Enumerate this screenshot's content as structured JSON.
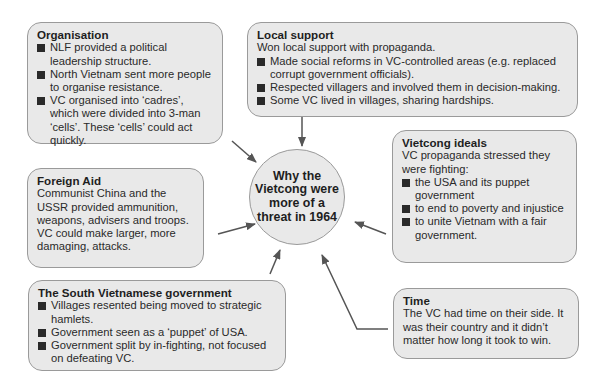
{
  "center": {
    "title": "Why the Vietcong were more of a threat in 1964"
  },
  "boxes": {
    "organisation": {
      "title": "Organisation",
      "bullets": [
        "NLF provided a political leadership structure.",
        "North Vietnam sent more people to organise resistance.",
        "VC organised into ‘cadres’, which were divided into 3-man ‘cells’. These ‘cells’ could act quickly."
      ]
    },
    "local_support": {
      "title": "Local support",
      "intro": "Won local support with propaganda.",
      "bullets": [
        "Made social reforms in VC-controlled areas (e.g. replaced corrupt government officials).",
        "Respected villagers and involved them in decision-making.",
        "Some VC lived in villages, sharing hardships."
      ]
    },
    "vietcong_ideals": {
      "title": "Vietcong ideals",
      "intro": "VC propaganda stressed they were fighting:",
      "bullets": [
        "the USA and its puppet government",
        "to end to poverty and injustice",
        "to unite Vietnam with a fair government."
      ]
    },
    "foreign_aid": {
      "title": "Foreign Aid",
      "text": "Communist China and the USSR provided ammunition, weapons, advisers and troops. VC could make larger, more damaging, attacks."
    },
    "south_vietnamese_government": {
      "title": "The South Vietnamese government",
      "bullets": [
        "Villages resented being moved to strategic hamlets.",
        "Government seen as a ‘puppet’ of USA.",
        "Government split by in-fighting, not focused on defeating VC."
      ]
    },
    "time": {
      "title": "Time",
      "text": "The VC had time on their side. It was their country and it didn’t matter how long it took to win."
    }
  },
  "colors": {
    "box_fill": "#e9e9e9",
    "box_border": "#9a9a9a",
    "arrow": "#555555",
    "text": "#2a2a2a"
  }
}
